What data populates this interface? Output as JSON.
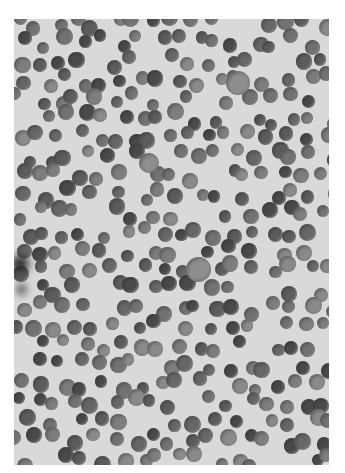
{
  "image": {
    "subject": "histology micrograph of densely packed round nuclei",
    "frame": {
      "left": 14,
      "top": 19,
      "width": 315,
      "height": 446
    },
    "background_color": "#d9d9d9",
    "nucleus_colors": [
      "#5c5c5c",
      "#676767",
      "#727272",
      "#7d7d7d",
      "#4a4a4a",
      "#8a8a8a"
    ],
    "nucleus_diameter_range": [
      12,
      17
    ],
    "large_nuclei": [
      {
        "x": 238,
        "y": 83,
        "d": 24
      },
      {
        "x": 198,
        "y": 269,
        "d": 25
      },
      {
        "x": 149,
        "y": 163,
        "d": 20
      }
    ],
    "dark_blobs": [
      {
        "x": 20,
        "y": 264,
        "d": 18,
        "color": "#2a2a2a"
      },
      {
        "x": 21,
        "y": 289,
        "d": 9,
        "color": "#1e1e1e"
      }
    ],
    "grid_spacing": 19,
    "seed": 7
  }
}
